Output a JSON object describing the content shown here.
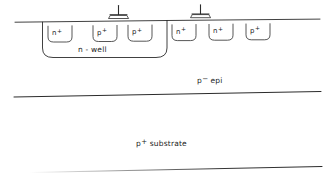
{
  "diagram": {
    "type": "semiconductor-cross-section",
    "stroke_color": "#2b2b2b",
    "text_color": "#1a1a1a",
    "background_color": "#ffffff",
    "diffusions": [
      {
        "id": "d1",
        "base": "n",
        "charge": "+",
        "label": "n+",
        "x": 48,
        "y": 26,
        "w": 24,
        "h": 16,
        "in_well": true
      },
      {
        "id": "d2",
        "base": "p",
        "charge": "+",
        "label": "p+",
        "x": 93,
        "y": 26,
        "w": 24,
        "h": 16,
        "in_well": true
      },
      {
        "id": "d3",
        "base": "p",
        "charge": "+",
        "label": "p+",
        "x": 128,
        "y": 26,
        "w": 24,
        "h": 16,
        "in_well": true
      },
      {
        "id": "d4",
        "base": "n",
        "charge": "+",
        "label": "n+",
        "x": 172,
        "y": 26,
        "w": 24,
        "h": 16,
        "in_well": false
      },
      {
        "id": "d5",
        "base": "n",
        "charge": "+",
        "label": "n+",
        "x": 209,
        "y": 26,
        "w": 24,
        "h": 16,
        "in_well": false
      },
      {
        "id": "d6",
        "base": "p",
        "charge": "+",
        "label": "p+",
        "x": 246,
        "y": 26,
        "w": 24,
        "h": 16,
        "in_well": false
      }
    ],
    "contacts": [
      {
        "id": "c1",
        "name": "ground-contact-left",
        "x": 117,
        "y": 8
      },
      {
        "id": "c2",
        "name": "ground-contact-right",
        "x": 199,
        "y": 8
      }
    ],
    "regions": [
      {
        "id": "r1",
        "name": "n-well",
        "label": "n - well",
        "sup": "",
        "x": 78,
        "y": 46
      },
      {
        "id": "r2",
        "name": "p-epi",
        "label": "p",
        "sup": "−",
        "suffix": " epi",
        "x": 197,
        "y": 77
      },
      {
        "id": "r3",
        "name": "p-substrate",
        "label": "p",
        "sup": "+",
        "suffix": " substrate",
        "x": 136,
        "y": 140
      }
    ],
    "boundaries": [
      {
        "id": "b1",
        "name": "wafer-surface-line",
        "x1": 15,
        "y1": 22,
        "x2": 320,
        "y2": 19
      },
      {
        "id": "b2",
        "name": "epi-substrate-boundary",
        "x1": 14,
        "y1": 97,
        "x2": 321,
        "y2": 92
      },
      {
        "id": "b3",
        "name": "substrate-bottom-edge",
        "x1": 40,
        "y1": 172,
        "x2": 322,
        "y2": 166
      }
    ]
  }
}
